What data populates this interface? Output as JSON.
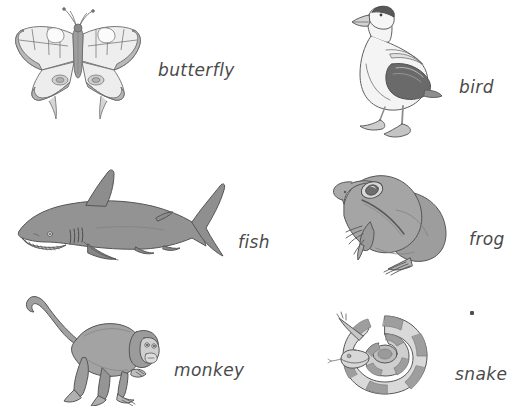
{
  "page": {
    "background_color": "#ffffff",
    "ink_color": "#4a4a4a"
  },
  "palette": {
    "outline": "#5a5a5a",
    "light_gray": "#e3e3e3",
    "mid_gray": "#b0b0b0",
    "dark_gray": "#6e6e6e",
    "body_gray": "#9a9a9a",
    "pale": "#f1f1f1"
  },
  "items": [
    {
      "id": "butterfly",
      "label": "butterfly",
      "icon_name": "butterfly-illustration",
      "row": 1,
      "column": 1,
      "label_position": "right"
    },
    {
      "id": "bird",
      "label": "bird",
      "icon_name": "bird-illustration",
      "row": 1,
      "column": 2,
      "label_position": "right"
    },
    {
      "id": "fish",
      "label": "fish",
      "icon_name": "fish-illustration",
      "row": 2,
      "column": 1,
      "label_position": "right"
    },
    {
      "id": "frog",
      "label": "frog",
      "icon_name": "frog-illustration",
      "row": 2,
      "column": 2,
      "label_position": "right"
    },
    {
      "id": "monkey",
      "label": "monkey",
      "icon_name": "monkey-illustration",
      "row": 3,
      "column": 1,
      "label_position": "right"
    },
    {
      "id": "snake",
      "label": "snake",
      "icon_name": "snake-illustration",
      "row": 3,
      "column": 2,
      "label_position": "right"
    }
  ],
  "marks": {
    "stray_dot": "."
  }
}
